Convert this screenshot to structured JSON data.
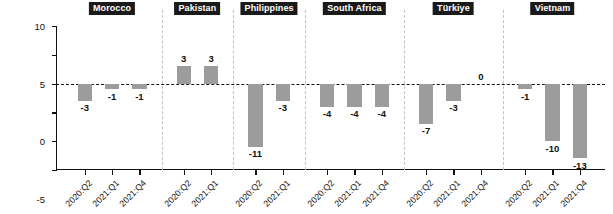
{
  "chart_data": {
    "type": "bar",
    "title": "",
    "subtitle": "",
    "xlabel": "",
    "ylabel": "Percentage point change",
    "ylim": [
      -15,
      10
    ],
    "yticks": [
      10,
      5,
      0,
      -5,
      -10,
      -15
    ],
    "ytick_labels": [
      "10",
      "5",
      "0",
      "-5",
      "-10",
      "-15"
    ],
    "grid": false,
    "legend": "none",
    "zero_reference_line": true,
    "bar_color": "#9c9c9c",
    "groups": [
      {
        "name": "Morocco",
        "categories": [
          "2020:Q2",
          "2021:Q1",
          "2021:Q4"
        ],
        "values": [
          -3,
          -1,
          -1
        ],
        "value_labels": [
          "-3",
          "-1",
          "-1"
        ]
      },
      {
        "name": "Pakistan",
        "categories": [
          "2020:Q2",
          "2021:Q1"
        ],
        "values": [
          3,
          3
        ],
        "value_labels": [
          "3",
          "3"
        ]
      },
      {
        "name": "Philippines",
        "categories": [
          "2020:Q2",
          "2021:Q1"
        ],
        "values": [
          -11,
          -3
        ],
        "value_labels": [
          "-11",
          "-3"
        ]
      },
      {
        "name": "South Africa",
        "categories": [
          "2020:Q2",
          "2021:Q1",
          "2021:Q4"
        ],
        "values": [
          -4,
          -4,
          -4
        ],
        "value_labels": [
          "-4",
          "-4",
          "-4"
        ]
      },
      {
        "name": "Türkiye",
        "categories": [
          "2020:Q2",
          "2021:Q1",
          "2021:Q4"
        ],
        "values": [
          -7,
          -3,
          0
        ],
        "value_labels": [
          "-7",
          "-3",
          "0"
        ]
      },
      {
        "name": "Vietnam",
        "categories": [
          "2020:Q2",
          "2021:Q1",
          "2021:Q4"
        ],
        "values": [
          -1,
          -10,
          -13
        ],
        "value_labels": [
          "-1",
          "-10",
          "-13"
        ]
      }
    ]
  }
}
